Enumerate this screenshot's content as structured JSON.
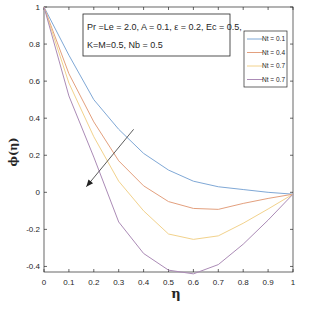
{
  "chart_data": {
    "type": "line",
    "title": "",
    "xlabel": "η",
    "ylabel": "ϕ(η)",
    "xlim": [
      0,
      1
    ],
    "ylim": [
      -0.43,
      1
    ],
    "grid": false,
    "x": [
      0,
      0.1,
      0.2,
      0.3,
      0.4,
      0.5,
      0.6,
      0.7,
      0.8,
      0.9,
      1.0
    ],
    "xticks": [
      0,
      0.1,
      0.2,
      0.3,
      0.4,
      0.5,
      0.6,
      0.7,
      0.8,
      0.9,
      1
    ],
    "xtick_labels": [
      "0",
      "0.1",
      "0.2",
      "0.3",
      "0.4",
      "0.5",
      "0.6",
      "0.7",
      "0.8",
      "0.9",
      "1"
    ],
    "yticks": [
      -0.4,
      -0.2,
      0,
      0.2,
      0.4,
      0.6,
      0.8,
      1
    ],
    "ytick_labels": [
      "-0.4",
      "-0.2",
      "0",
      "0.2",
      "0.4",
      "0.6",
      "0.8",
      "1"
    ],
    "series": [
      {
        "name": "Nt = 0.1",
        "color": "#7fa8d6",
        "values": [
          1.0,
          0.74,
          0.5,
          0.34,
          0.21,
          0.12,
          0.06,
          0.03,
          0.015,
          0.0,
          -0.01
        ]
      },
      {
        "name": "Nt = 0.4",
        "color": "#e3a07e",
        "values": [
          1.0,
          0.64,
          0.38,
          0.17,
          0.035,
          -0.05,
          -0.087,
          -0.092,
          -0.06,
          -0.033,
          -0.01
        ]
      },
      {
        "name": "Nt = 0.7",
        "color": "#f2d28c",
        "values": [
          1.0,
          0.59,
          0.3,
          0.06,
          -0.1,
          -0.225,
          -0.254,
          -0.235,
          -0.167,
          -0.09,
          -0.01
        ]
      },
      {
        "name": "Nt = 0.7",
        "color": "#ab8bb6",
        "values": [
          1.0,
          0.52,
          0.19,
          -0.16,
          -0.33,
          -0.42,
          -0.44,
          -0.39,
          -0.28,
          -0.15,
          -0.01
        ]
      }
    ],
    "annotations": [
      {
        "type": "text-box",
        "lines": [
          "Pr =Le = 2.0, A = 0.1, ε = 0.2, Ec = 0.5,",
          "K=M=0.5, Nb = 0.5"
        ]
      },
      {
        "type": "arrow",
        "from": [
          0.36,
          0.34
        ],
        "to": [
          0.17,
          0.03
        ],
        "meaning": "increasing Nt"
      }
    ],
    "legend": {
      "position": "upper right",
      "entries": [
        "Nt = 0.1",
        "Nt = 0.4",
        "Nt = 0.7",
        "Nt = 0.7"
      ]
    }
  }
}
